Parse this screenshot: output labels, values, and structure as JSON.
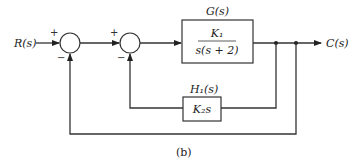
{
  "diagram": {
    "type": "block-diagram",
    "caption": "(b)",
    "input": {
      "label": "R(s)"
    },
    "output": {
      "label": "C(s)"
    },
    "summers": [
      {
        "id": "sum1",
        "signs": {
          "top": "+",
          "bottom": "−"
        }
      },
      {
        "id": "sum2",
        "signs": {
          "top": "+",
          "bottom": "−"
        }
      }
    ],
    "blocks": [
      {
        "id": "G",
        "title": "G(s)",
        "numerator": "K₁",
        "denominator": "s(s + 2)"
      },
      {
        "id": "H1",
        "title": "H₁(s)",
        "content": "K₂s"
      }
    ],
    "connections": [
      "R(s) → sum1 (+)",
      "sum1 → sum2 (+)",
      "sum2 → G(s)",
      "G(s) → C(s)",
      "C(s) → H₁(s) → sum2 (−)",
      "C(s) → sum1 (−) unity feedback"
    ]
  }
}
